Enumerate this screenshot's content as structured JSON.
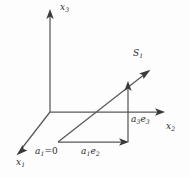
{
  "figure": {
    "name": "vector-decomposition-3d-axes",
    "background_color": "#fdfdfd",
    "line_color": "#58585a",
    "text_color": "#2c2c2e",
    "axes": [
      {
        "id": "x1",
        "label_main": "x",
        "label_sub": "1",
        "direction": "down-left",
        "from": [
          50,
          112
        ],
        "to": [
          18,
          152
        ]
      },
      {
        "id": "x2",
        "label_main": "x",
        "label_sub": "2",
        "direction": "right",
        "from": [
          50,
          112
        ],
        "to": [
          165,
          112
        ]
      },
      {
        "id": "x3",
        "label_main": "x",
        "label_sub": "3",
        "direction": "up",
        "from": [
          50,
          112
        ],
        "to": [
          50,
          12
        ]
      }
    ],
    "vectors": [
      {
        "id": "s1",
        "label_main": "S",
        "label_sub": "1",
        "from": [
          58,
          142
        ],
        "to": [
          150,
          70
        ],
        "description": "diagonal resultant vector"
      },
      {
        "id": "a1e2",
        "label_prefix": "a",
        "label_prefix_sub": "1",
        "label_suffix": "e",
        "label_suffix_sub": "2",
        "from": [
          58,
          142
        ],
        "to": [
          128,
          142
        ],
        "description": "horizontal component along x2"
      },
      {
        "id": "a3e3",
        "label_prefix": "a",
        "label_prefix_sub": "3",
        "label_suffix": "e",
        "label_suffix_sub": "3",
        "from": [
          128,
          142
        ],
        "to": [
          128,
          84
        ],
        "description": "vertical component along x3"
      }
    ],
    "annotations": [
      {
        "id": "a1-zero",
        "label_main": "a",
        "label_sub": "1",
        "label_tail": "=0",
        "position": [
          35,
          147
        ],
        "description": "origin-side annotation of the first coefficient"
      }
    ]
  }
}
